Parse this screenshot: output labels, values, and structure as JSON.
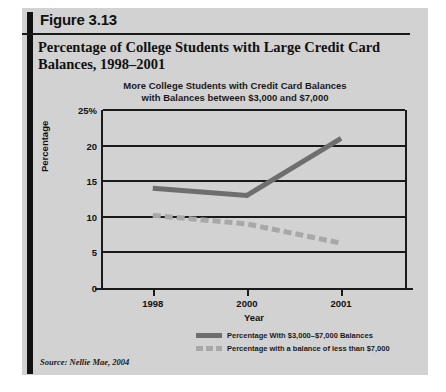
{
  "figure": {
    "number": "Figure 3.13",
    "title": "Percentage of College Students with Large Credit Card Balances, 1998–2001",
    "source": "Source: Nellie Mae, 2004"
  },
  "chart_data": {
    "type": "line",
    "title": "More College Students with Credit Card Balances with Balances between $3,000 and $7,000",
    "title_line1": "More College Students with Credit Card Balances",
    "title_line2": "with Balances between $3,000 and $7,000",
    "xlabel": "Year",
    "ylabel": "Percentage",
    "categories": [
      "1998",
      "2000",
      "2001"
    ],
    "x": [
      1998,
      2000,
      2001
    ],
    "ylim": [
      0,
      25
    ],
    "yticks": [
      0,
      5,
      10,
      15,
      20,
      25
    ],
    "ytick_labels": [
      "0",
      "5",
      "10",
      "15",
      "20",
      "25%"
    ],
    "grid": true,
    "legend_position": "bottom",
    "series": [
      {
        "name": "Percentage With $3,000–$7,000 Balances",
        "values": [
          14.0,
          13.0,
          21.0
        ],
        "color": "#6e6e6e",
        "style": "solid"
      },
      {
        "name": "Percentage with a balance of less than $7,000",
        "values": [
          10.2,
          9.0,
          6.3
        ],
        "color": "#a8a8a8",
        "style": "dashed"
      }
    ]
  },
  "colors": {
    "figure_background": "#d2d2d2",
    "spine": "#111111",
    "axis": "#1a1a1a",
    "series_solid": "#6e6e6e",
    "series_dashed": "#a8a8a8"
  }
}
